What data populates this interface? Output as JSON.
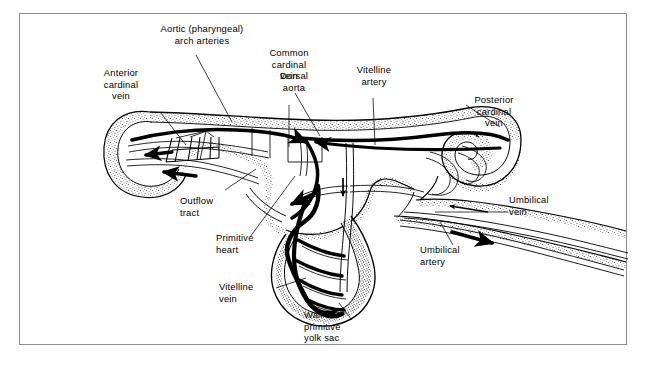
{
  "figure": {
    "frame_color": "#8d8d8d",
    "background": "#ffffff",
    "ink_color": "#000000",
    "labels": [
      {
        "name": "aortic-arch-arteries",
        "text": "Aortic (pharyngeal)\narch arteries"
      },
      {
        "name": "anterior-cardinal-vein",
        "text": "Anterior\ncardinal\nvein"
      },
      {
        "name": "dorsal-aorta",
        "text": "Dorsal\naorta"
      },
      {
        "name": "common-cardinal-vein",
        "text": "Common\ncardinal\nvein"
      },
      {
        "name": "vitelline-artery",
        "text": "Vitelline\nartery"
      },
      {
        "name": "posterior-cardinal-vein",
        "text": "Posterior\ncardinal\nvein"
      },
      {
        "name": "umbilical-vein",
        "text": "Umbilical\nvein"
      },
      {
        "name": "umbilical-artery",
        "text": "Umbilical\nartery"
      },
      {
        "name": "outflow-tract",
        "text": "Outflow\ntract"
      },
      {
        "name": "primitive-heart",
        "text": "Primitive\nheart"
      },
      {
        "name": "vitelline-vein",
        "text": "Vitelline\nvein"
      },
      {
        "name": "wall-of-primitive-yolk-sac",
        "text": "Wall of\nprimitive\nyolk sac"
      }
    ]
  }
}
